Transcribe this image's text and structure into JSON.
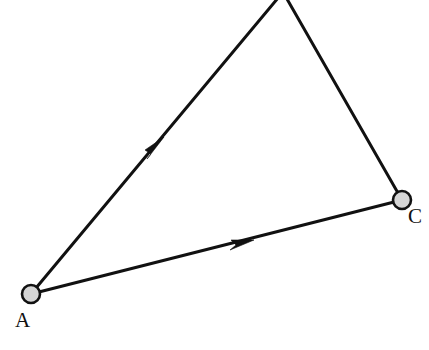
{
  "figure": {
    "background_color": "#ffffff",
    "width": 429,
    "height": 350,
    "line_color": "#111111",
    "line_width": 3,
    "vertex_fill_color": "#d5d5d5",
    "vertex_stroke_color": "#111111",
    "vertex_radius": 9
  },
  "vertices": [
    {
      "id": "A",
      "label": "A",
      "visible": true,
      "cx": 31,
      "cy": 294,
      "label_x": 15,
      "label_y": 327
    },
    {
      "id": "C",
      "label": "C",
      "visible": true,
      "cx": 402,
      "cy": 200,
      "label_x": 408,
      "label_y": 223
    },
    {
      "id": "B",
      "label": "",
      "visible": false,
      "cx": 283,
      "cy": -8,
      "label_x": 0,
      "label_y": 0
    }
  ],
  "edges": [
    {
      "id": "A-to-B",
      "from": "A",
      "to": "B",
      "directed": true,
      "path": "M 31 294 L 283 -8",
      "arrow_points": "164,137 145,150 151,154 147,159",
      "arrow_tip_x": 164,
      "arrow_tip_y": 137
    },
    {
      "id": "A-to-C",
      "from": "A",
      "to": "C",
      "directed": true,
      "path": "M 31 294 L 402 200",
      "arrow_points": "254,240 231,240 236,245 230,250",
      "arrow_tip_x": 254,
      "arrow_tip_y": 240
    },
    {
      "id": "B-to-C",
      "from": "B",
      "to": "C",
      "directed": false,
      "path": "M 283 -8 L 402 200",
      "arrow_points": "",
      "arrow_tip_x": 0,
      "arrow_tip_y": 0
    }
  ]
}
